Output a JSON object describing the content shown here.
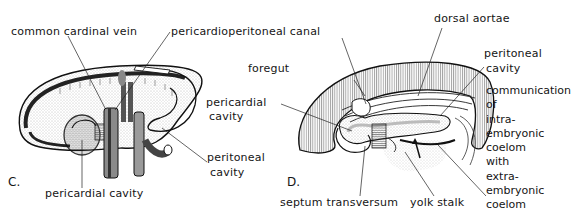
{
  "figure": {
    "panels": [
      {
        "id": "C",
        "letter": "C.",
        "labels": {
          "common_cardinal_vein": "common cardinal vein",
          "pericardioperitoneal_canal": "pericardioperitoneal canal",
          "peritoneal_cavity_1": "peritoneal",
          "peritoneal_cavity_2": "cavity",
          "pericardial_cavity": "pericardial cavity"
        }
      },
      {
        "id": "D",
        "letter": "D.",
        "labels": {
          "foregut": "foregut",
          "pericardial_cavity_1": "pericardial",
          "pericardial_cavity_2": "cavity",
          "dorsal_aortae": "dorsal aortae",
          "peritoneal_cavity_1": "peritoneal",
          "peritoneal_cavity_2": "cavity",
          "septum_transversum": "septum transversum",
          "yolk_stalk": "yolk stalk",
          "communication": [
            "communication",
            "of",
            "intra-",
            "embryonic",
            "coelom",
            "with",
            "extra-",
            "embryonic",
            "coelom"
          ]
        }
      }
    ],
    "colors": {
      "ink": "#151515",
      "background": "#ffffff",
      "shading": "#9a9a9a"
    }
  }
}
